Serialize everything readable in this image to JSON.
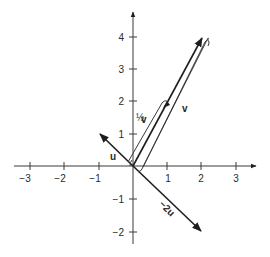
{
  "diagram": {
    "type": "vector-plot",
    "origin_px": [
      133,
      166
    ],
    "unit_px": [
      34,
      32.5
    ],
    "axes": {
      "x_ticks": [
        {
          "value": -3,
          "label": "−3"
        },
        {
          "value": -2,
          "label": "−2"
        },
        {
          "value": -1,
          "label": "−1"
        },
        {
          "value": 1,
          "label": "1"
        },
        {
          "value": 2,
          "label": "2"
        },
        {
          "value": 3,
          "label": "3"
        }
      ],
      "y_ticks": [
        {
          "value": 4,
          "label": "4"
        },
        {
          "value": 3,
          "label": "3"
        },
        {
          "value": 2,
          "label": "2"
        },
        {
          "value": 1,
          "label": "1"
        },
        {
          "value": -1,
          "label": "−1"
        },
        {
          "value": -2,
          "label": "−2"
        }
      ]
    },
    "vectors": [
      {
        "name": "u",
        "label": "u",
        "from": [
          0,
          0
        ],
        "to": [
          -1,
          1
        ]
      },
      {
        "name": "-2u",
        "label": "−2u",
        "from": [
          0,
          0
        ],
        "to": [
          2,
          -2
        ]
      },
      {
        "name": "v",
        "label": "v",
        "from": [
          0,
          0
        ],
        "to": [
          2,
          4
        ]
      },
      {
        "name": "half-v",
        "label": "½v",
        "from": [
          0,
          0
        ],
        "to": [
          1,
          2
        ]
      }
    ],
    "labels": {
      "u": "u",
      "neg2u": "−2u",
      "v": "v",
      "half_v_frac": "½",
      "half_v_letter": "v"
    }
  }
}
